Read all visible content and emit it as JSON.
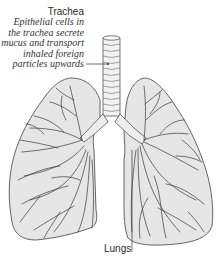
{
  "figure": {
    "colors": {
      "lung_fill": "#e6e6e6",
      "outline": "#555555",
      "vessel": "#3a3a3a",
      "text": "#2a2a2a",
      "background": "#ffffff"
    }
  },
  "annotations": {
    "trachea": {
      "title": "Trachea",
      "description_lines": [
        "Epithelial cells in",
        "the trachea secrete",
        "mucus and transport",
        "inhaled foreign",
        "particles upwards"
      ]
    },
    "lungs": {
      "title": "Lungs"
    }
  }
}
